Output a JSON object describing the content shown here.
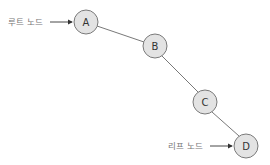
{
  "diagram": {
    "type": "tree-path",
    "nodes": [
      {
        "id": "A",
        "label": "A",
        "x": 86,
        "y": 22
      },
      {
        "id": "B",
        "label": "B",
        "x": 155,
        "y": 46
      },
      {
        "id": "C",
        "label": "C",
        "x": 205,
        "y": 102
      },
      {
        "id": "D",
        "label": "D",
        "x": 246,
        "y": 146
      }
    ],
    "edges": [
      {
        "from": "A",
        "to": "B"
      },
      {
        "from": "B",
        "to": "C"
      },
      {
        "from": "C",
        "to": "D"
      }
    ],
    "annotations": {
      "root": {
        "text": "루트 노드",
        "target": "A"
      },
      "leaf": {
        "text": "리프 노드",
        "target": "D"
      }
    }
  }
}
